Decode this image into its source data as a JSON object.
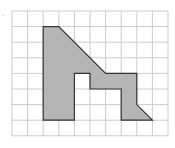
{
  "diagram": {
    "type": "grid-polygon",
    "grid": {
      "cols": 10,
      "rows": 8,
      "origin_px": [
        12,
        11
      ],
      "cell_px": 15.6,
      "line_color": "#cccccc"
    },
    "shape": {
      "fill": "#b5b5b5",
      "stroke": "#333333",
      "vertices_grid": [
        [
          2,
          1
        ],
        [
          3,
          1
        ],
        [
          6,
          4
        ],
        [
          8,
          4
        ],
        [
          8,
          6
        ],
        [
          9,
          7
        ],
        [
          7,
          7
        ],
        [
          7,
          5
        ],
        [
          5,
          5
        ],
        [
          5,
          4
        ],
        [
          4,
          4
        ],
        [
          4,
          7
        ],
        [
          2,
          7
        ]
      ]
    },
    "corner_mark": "."
  }
}
